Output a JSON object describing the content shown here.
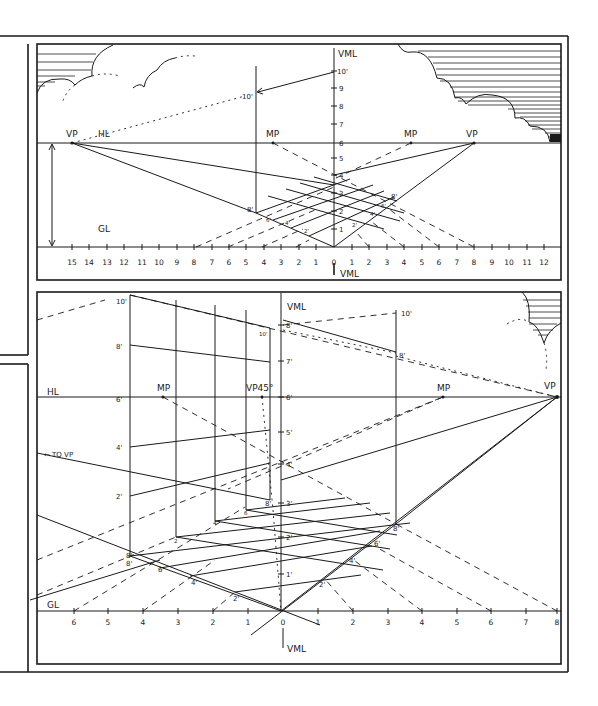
{
  "top_panel": {
    "labels": {
      "vml_top": "VML",
      "vml_bottom": "VML",
      "hl": "HL",
      "gl": "GL",
      "vp_left": "VP",
      "vp_right": "VP",
      "mp_left": "MP",
      "mp_right": "MP",
      "height_10": "10'",
      "vml_10": "10'",
      "corner_8": "8'",
      "right_8": "8'",
      "grid_6": "6'",
      "grid_4": "4'",
      "grid_2": "2'",
      "grid_r2": "2'",
      "grid_r4": "4'",
      "grid_r6": "6'"
    },
    "vml_ticks": [
      "1",
      "2",
      "3",
      "4",
      "5",
      "6",
      "7",
      "8",
      "9"
    ],
    "ground_scale_left": [
      "15",
      "14",
      "13",
      "12",
      "11",
      "10",
      "9",
      "8",
      "7",
      "6",
      "5",
      "4",
      "3",
      "2",
      "1"
    ],
    "ground_scale_zero": "0",
    "ground_scale_right": [
      "1",
      "2",
      "3",
      "4",
      "5",
      "6",
      "7",
      "8",
      "9",
      "10",
      "11",
      "12"
    ]
  },
  "bottom_panel": {
    "labels": {
      "vml_top": "VML",
      "vml_bottom": "VML",
      "hl": "HL",
      "gl": "GL",
      "mp_left": "MP",
      "mp_right": "MP",
      "vp45": "VP45°",
      "vp_right": "VP",
      "to_vp": "← TO VP",
      "left_10": "10'",
      "left_8": "8'",
      "left_6": "6'",
      "left_4": "4'",
      "left_2": "2'",
      "left_base_8": "8'",
      "near_10": "10'",
      "right_10": "10'",
      "right_8": "8'",
      "right_base_8": "8'",
      "right_6": "6'",
      "right_4": "4'",
      "right_2": "2'",
      "floor_6": "6'",
      "floor_4": "4'",
      "floor_2": "2'",
      "floor_small_2": "2",
      "floor_small_4": "4",
      "floor_small_6": "6",
      "floor_small_8": "8'"
    },
    "vml_ticks": [
      "8'",
      "7'",
      "6'",
      "5'",
      "4'",
      "3'",
      "2'",
      "1'"
    ],
    "ground_scale_left": [
      "6",
      "5",
      "4",
      "3",
      "2",
      "1"
    ],
    "ground_scale_zero": "0",
    "ground_scale_right": [
      "1",
      "2",
      "3",
      "4",
      "5",
      "6",
      "7",
      "8"
    ]
  }
}
